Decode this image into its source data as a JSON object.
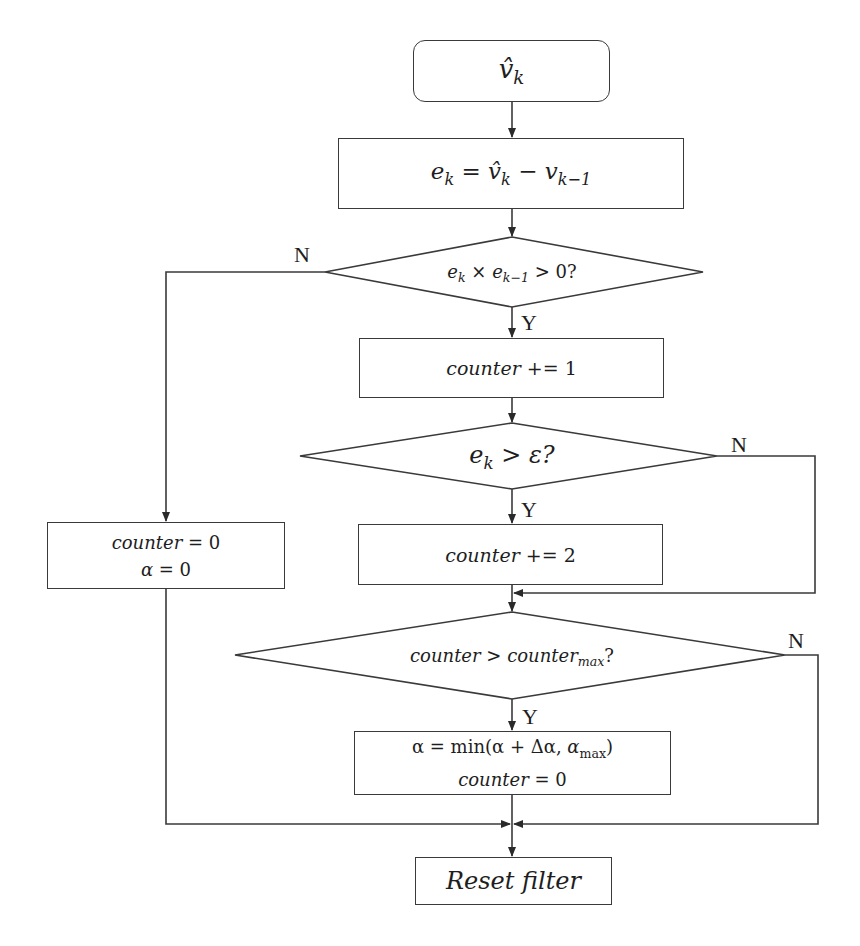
{
  "diagram": {
    "type": "flowchart",
    "nodes": {
      "start": {
        "shape": "rounded-rect",
        "text": "v̂",
        "sub": "k"
      },
      "error": {
        "shape": "rect",
        "lhs": "e",
        "lhs_sub": "k",
        "eq": " = ",
        "mid": "v̂",
        "mid_sub": "k",
        "minus": " − v",
        "rhs_sub": "k−1"
      },
      "sign_check": {
        "shape": "diamond",
        "a": "e",
        "a_sub": "k",
        "op": " × e",
        "b_sub": "k−1",
        "tail": " > 0?"
      },
      "inc1": {
        "shape": "rect",
        "text": "counter",
        "op": " += 1"
      },
      "threshold_check": {
        "shape": "diamond",
        "a": "e",
        "a_sub": "k",
        "tail": " > ε?"
      },
      "inc2": {
        "shape": "rect",
        "text": "counter",
        "op": " += 2"
      },
      "reset_counter": {
        "shape": "rect",
        "line1_a": "counter",
        "line1_b": " = 0",
        "line2_a": "α",
        "line2_b": " = 0"
      },
      "max_check": {
        "shape": "diamond",
        "a": "counter > counter",
        "a_sub": "max",
        "tail": "?"
      },
      "update_alpha": {
        "shape": "rect",
        "line1_a": "α = min(α + Δα, ",
        "line1_b": "α",
        "line1_sub": "max",
        "line1_c": ")",
        "line2_a": "counter",
        "line2_b": " = 0"
      },
      "end": {
        "shape": "rect",
        "text": "Reset filter"
      }
    },
    "edge_labels": {
      "sign_no": "N",
      "sign_yes": "Y",
      "threshold_no": "N",
      "threshold_yes": "Y",
      "max_no": "N",
      "max_yes": "Y"
    }
  }
}
